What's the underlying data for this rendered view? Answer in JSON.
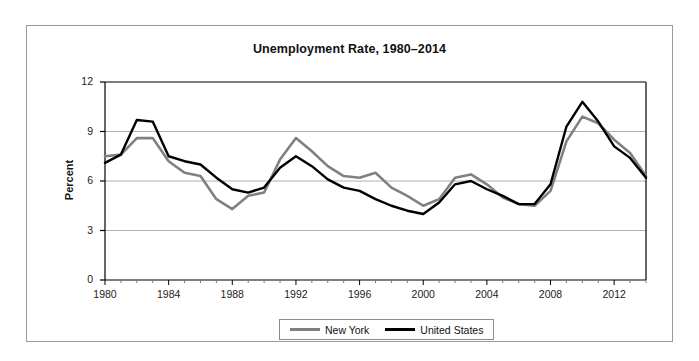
{
  "chart_data": {
    "type": "line",
    "title": "Unemployment Rate, 1980–2014",
    "xlabel": "",
    "ylabel": "Percent",
    "ylim": [
      0,
      12
    ],
    "xlim": [
      1980,
      2014
    ],
    "yticks": [
      "0",
      "3",
      "6",
      "9",
      "12"
    ],
    "ytick_values": [
      0,
      3,
      6,
      9,
      12
    ],
    "xticks": [
      "1980",
      "1984",
      "1988",
      "1992",
      "1996",
      "2000",
      "2004",
      "2008",
      "2012"
    ],
    "xtick_values": [
      1980,
      1984,
      1988,
      1992,
      1996,
      2000,
      2004,
      2008,
      2012
    ],
    "grid": "horizontal",
    "legend_position": "bottom-center",
    "x": [
      1980,
      1981,
      1982,
      1983,
      1984,
      1985,
      1986,
      1987,
      1988,
      1989,
      1990,
      1991,
      1992,
      1993,
      1994,
      1995,
      1996,
      1997,
      1998,
      1999,
      2000,
      2001,
      2002,
      2003,
      2004,
      2005,
      2006,
      2007,
      2008,
      2009,
      2010,
      2011,
      2012,
      2013,
      2014
    ],
    "series": [
      {
        "name": "New York",
        "color": "#808080",
        "values": [
          7.5,
          7.6,
          8.6,
          8.6,
          7.2,
          6.5,
          6.3,
          4.9,
          4.3,
          5.1,
          5.3,
          7.3,
          8.6,
          7.8,
          6.9,
          6.3,
          6.2,
          6.5,
          5.6,
          5.1,
          4.5,
          4.9,
          6.2,
          6.4,
          5.8,
          5.0,
          4.6,
          4.5,
          5.4,
          8.4,
          9.9,
          9.5,
          8.5,
          7.7,
          6.3
        ]
      },
      {
        "name": "United States",
        "color": "#000000",
        "values": [
          7.1,
          7.6,
          9.7,
          9.6,
          7.5,
          7.2,
          7.0,
          6.2,
          5.5,
          5.3,
          5.6,
          6.8,
          7.5,
          6.9,
          6.1,
          5.6,
          5.4,
          4.9,
          4.5,
          4.2,
          4.0,
          4.7,
          5.8,
          6.0,
          5.5,
          5.1,
          4.6,
          4.6,
          5.8,
          9.3,
          10.8,
          9.6,
          8.1,
          7.4,
          6.2
        ]
      }
    ]
  },
  "legend": {
    "entries": [
      {
        "label": "New York",
        "color": "#808080"
      },
      {
        "label": "United States",
        "color": "#000000"
      }
    ]
  },
  "axes": {
    "y_title": "Percent"
  }
}
